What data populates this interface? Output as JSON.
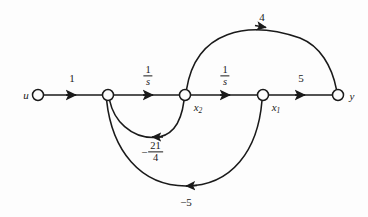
{
  "diagram": {
    "background_color": "#fdfdfd",
    "stroke_color": "#1a1a1a",
    "nodes": [
      {
        "id": "u",
        "label": "u",
        "x": 38,
        "y": 95,
        "label_x": 26,
        "label_y": 95,
        "r": 5.5
      },
      {
        "id": "n2",
        "label": "",
        "x": 108,
        "y": 95,
        "label_x": 108,
        "label_y": 95,
        "r": 5.5
      },
      {
        "id": "x2",
        "label": "x2",
        "x": 185,
        "y": 95,
        "label_x": 196,
        "label_y": 107,
        "r": 5.5
      },
      {
        "id": "x1",
        "label": "x1",
        "x": 263,
        "y": 95,
        "label_x": 274,
        "label_y": 107,
        "r": 5.5
      },
      {
        "id": "y",
        "label": "y",
        "x": 338,
        "y": 95,
        "label_x": 352,
        "label_y": 96,
        "r": 5.5
      }
    ],
    "edges": [
      {
        "from": "u",
        "to": "n2",
        "gain": "1",
        "gain_kind": "plain",
        "gain_x": 72,
        "gain_y": 78
      },
      {
        "from": "n2",
        "to": "x2",
        "gain": "1/s",
        "gain_kind": "fraction",
        "num": "1",
        "den": "s",
        "gain_x": 148,
        "gain_y": 76
      },
      {
        "from": "x2",
        "to": "x1",
        "gain": "1/s",
        "gain_kind": "fraction",
        "num": "1",
        "den": "s",
        "gain_x": 225,
        "gain_y": 76
      },
      {
        "from": "x1",
        "to": "y",
        "gain": "5",
        "gain_kind": "plain",
        "gain_x": 301,
        "gain_y": 78
      },
      {
        "from": "x2",
        "to": "y",
        "gain": "4",
        "gain_kind": "plain",
        "gain_x": 262,
        "gain_y": 17,
        "shape": "arc-over"
      },
      {
        "from": "x2",
        "to": "n2",
        "gain": "-21/4",
        "gain_kind": "signed-fraction",
        "sign": "−",
        "num": "21",
        "den": "4",
        "gain_x": 152,
        "gain_y": 152,
        "shape": "arc-under-inner"
      },
      {
        "from": "x1",
        "to": "n2",
        "gain": "-5",
        "gain_kind": "plain",
        "sign": "−",
        "gain_x": 186,
        "gain_y": 202,
        "shape": "arc-under-outer"
      }
    ],
    "gain_labels": {
      "forward_1": "1",
      "integrator_1_num": "1",
      "integrator_1_den": "s",
      "integrator_2_num": "1",
      "integrator_2_den": "s",
      "output_gain": "5",
      "feedforward_gain": "4",
      "inner_feedback_sign": "−",
      "inner_feedback_num": "21",
      "inner_feedback_den": "4",
      "outer_feedback": "−5"
    },
    "node_labels": {
      "input": "u",
      "state_2": "x",
      "state_2_sub": "2",
      "state_1": "x",
      "state_1_sub": "1",
      "output": "y"
    }
  }
}
